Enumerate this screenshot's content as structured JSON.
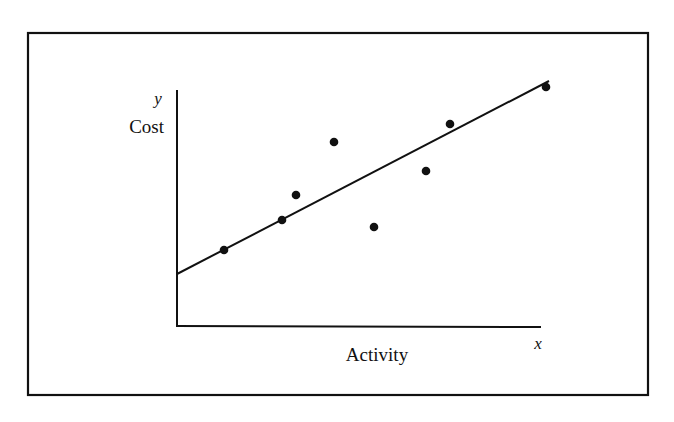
{
  "figure": {
    "frame": {
      "x1": 28,
      "y1": 33,
      "x2": 648,
      "y2": 395
    },
    "axes": {
      "origin": {
        "x": 177,
        "y": 326
      },
      "y_top": 90,
      "x_right": 541
    },
    "labels": {
      "y_symbol": "y",
      "y_name": "Cost",
      "x_symbol": "x",
      "x_name": "Activity"
    },
    "colors": {
      "ink": "#111111",
      "background": "#ffffff"
    }
  },
  "chart_data": {
    "type": "scatter",
    "title": "",
    "xlabel": "Activity",
    "ylabel": "Cost",
    "x_symbol": "x",
    "y_symbol": "y",
    "grid": false,
    "ticks": false,
    "points_pixel": [
      {
        "x": 224,
        "y": 250
      },
      {
        "x": 282,
        "y": 220
      },
      {
        "x": 296,
        "y": 195
      },
      {
        "x": 334,
        "y": 142
      },
      {
        "x": 374,
        "y": 227
      },
      {
        "x": 426,
        "y": 171
      },
      {
        "x": 450,
        "y": 124
      },
      {
        "x": 546,
        "y": 87
      }
    ],
    "points_relative": [
      {
        "x": 13,
        "y": 32
      },
      {
        "x": 29,
        "y": 45
      },
      {
        "x": 33,
        "y": 55
      },
      {
        "x": 43,
        "y": 78
      },
      {
        "x": 54,
        "y": 42
      },
      {
        "x": 68,
        "y": 66
      },
      {
        "x": 75,
        "y": 86
      },
      {
        "x": 101,
        "y": 101
      }
    ],
    "regression_line": {
      "description": "Least-squares fit line with positive intercept on cost axis (fixed cost)",
      "start_pixel": {
        "x": 177,
        "y": 274
      },
      "end_pixel": {
        "x": 549,
        "y": 81
      },
      "intercept_relative": 22,
      "slope_relative": 0.52
    },
    "axis_ranges_relative": {
      "x": [
        0,
        100
      ],
      "y": [
        0,
        100
      ]
    }
  }
}
